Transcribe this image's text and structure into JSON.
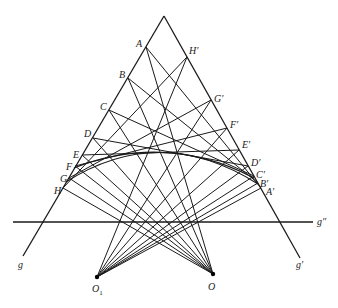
{
  "diagram": {
    "apex": [
      164,
      16
    ],
    "lines": {
      "g": {
        "label": "g",
        "from": [
          164,
          16
        ],
        "to": [
          23,
          256
        ],
        "label_pos": [
          18,
          268
        ]
      },
      "g_prime": {
        "label": "g′",
        "from": [
          164,
          16
        ],
        "to": [
          300,
          258
        ],
        "label_pos": [
          296,
          268
        ]
      },
      "g_double": {
        "label": "g″",
        "from": [
          13,
          222
        ],
        "to": [
          313,
          222
        ],
        "label_pos": [
          317,
          225
        ]
      }
    },
    "centers": {
      "O1": {
        "label": "O",
        "subscript": "1",
        "pos": [
          97,
          277
        ],
        "label_pos": [
          92,
          292
        ]
      },
      "O": {
        "label": "O",
        "pos": [
          213,
          274
        ],
        "label_pos": [
          208,
          290
        ]
      }
    },
    "left_points": [
      {
        "label": "A",
        "pos": [
          146,
          47
        ],
        "label_pos": [
          136,
          47
        ]
      },
      {
        "label": "B",
        "pos": [
          128,
          78
        ],
        "label_pos": [
          119,
          78
        ]
      },
      {
        "label": "C",
        "pos": [
          109,
          110
        ],
        "label_pos": [
          100,
          110
        ]
      },
      {
        "label": "D",
        "pos": [
          93,
          138
        ],
        "label_pos": [
          84,
          137
        ]
      },
      {
        "label": "E",
        "pos": [
          82,
          155
        ],
        "label_pos": [
          73,
          158
        ]
      },
      {
        "label": "F",
        "pos": [
          75,
          166
        ],
        "label_pos": [
          66,
          170
        ]
      },
      {
        "label": "G",
        "pos": [
          69,
          178
        ],
        "label_pos": [
          60,
          182
        ]
      },
      {
        "label": "H",
        "pos": [
          63,
          188
        ],
        "label_pos": [
          54,
          194
        ]
      }
    ],
    "right_points": [
      {
        "label": "H′",
        "pos": [
          187,
          57
        ],
        "label_pos": [
          189,
          54
        ]
      },
      {
        "label": "G′",
        "pos": [
          211,
          100
        ],
        "label_pos": [
          214,
          102
        ]
      },
      {
        "label": "F′",
        "pos": [
          227,
          128
        ],
        "label_pos": [
          230,
          128
        ]
      },
      {
        "label": "E′",
        "pos": [
          239,
          150
        ],
        "label_pos": [
          242,
          148
        ]
      },
      {
        "label": "D′",
        "pos": [
          248,
          166
        ],
        "label_pos": [
          251,
          166
        ]
      },
      {
        "label": "C′",
        "pos": [
          254,
          176
        ],
        "label_pos": [
          256,
          178
        ]
      },
      {
        "label": "B′",
        "pos": [
          258,
          183
        ],
        "label_pos": [
          260,
          187
        ]
      },
      {
        "label": "A′",
        "pos": [
          261,
          188
        ],
        "label_pos": [
          266,
          195
        ]
      }
    ],
    "pairings": [
      [
        "A",
        "A′"
      ],
      [
        "B",
        "B′"
      ],
      [
        "C",
        "C′"
      ],
      [
        "D",
        "D′"
      ],
      [
        "E",
        "E′"
      ],
      [
        "F",
        "F′"
      ],
      [
        "G",
        "G′"
      ],
      [
        "H",
        "H′"
      ]
    ],
    "arcs": [
      {
        "from": [
          66,
          182
        ],
        "control": [
          160,
          122
        ],
        "to": [
          258,
          184
        ]
      },
      {
        "from": [
          74,
          168
        ],
        "control": [
          166,
          132
        ],
        "to": [
          254,
          178
        ]
      }
    ],
    "stroke_color": "#1a1a1a",
    "background": "#ffffff"
  }
}
